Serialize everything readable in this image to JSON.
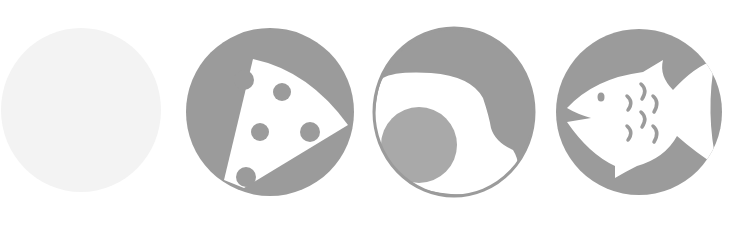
{
  "icons": [
    {
      "id": "blank",
      "name": "blank-circle-icon",
      "fill": "#f3f3f3"
    },
    {
      "id": "cheese",
      "name": "cheese-icon",
      "fill": "#9b9b9b",
      "cut": "#ffffff"
    },
    {
      "id": "egg",
      "name": "fried-egg-icon",
      "fill": "#9b9b9b",
      "yolk": "#a9a9a9",
      "cut": "#ffffff"
    },
    {
      "id": "fish",
      "name": "fish-icon",
      "fill": "#9b9b9b",
      "cut": "#ffffff"
    }
  ],
  "colors": {
    "background": "#ffffff",
    "placeholder": "#f3f3f3",
    "icon_gray": "#9b9b9b",
    "yolk_gray": "#a9a9a9"
  }
}
